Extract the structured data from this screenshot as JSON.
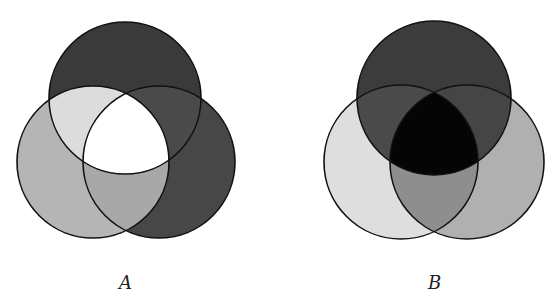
{
  "diagrams": [
    {
      "label": "A",
      "label_pos": [
        119,
        272
      ],
      "circles": {
        "top": {
          "cx": 125,
          "cy": 98,
          "r": 76
        },
        "left": {
          "cx": 93,
          "cy": 162,
          "r": 76
        },
        "right": {
          "cx": 159,
          "cy": 162,
          "r": 76
        }
      },
      "region_fills": {
        "top_only": "#3a3a3a",
        "left_only": "#b5b5b5",
        "right_only": "#474747",
        "top_left": "#dcdcdc",
        "top_right": "#4a4a4a",
        "left_right": "#a8a8a8",
        "all_three": "#ffffff"
      }
    },
    {
      "label": "B",
      "label_pos": [
        428,
        272
      ],
      "circles": {
        "top": {
          "cx": 434,
          "cy": 98,
          "r": 77
        },
        "left": {
          "cx": 401,
          "cy": 162,
          "r": 77
        },
        "right": {
          "cx": 467,
          "cy": 162,
          "r": 77
        }
      },
      "region_fills": {
        "top_only": "#3c3c3c",
        "left_only": "#dedede",
        "right_only": "#b0b0b0",
        "top_left": "#4a4a4a",
        "top_right": "#454545",
        "left_right": "#8e8e8e",
        "all_three": "#050505"
      }
    }
  ]
}
